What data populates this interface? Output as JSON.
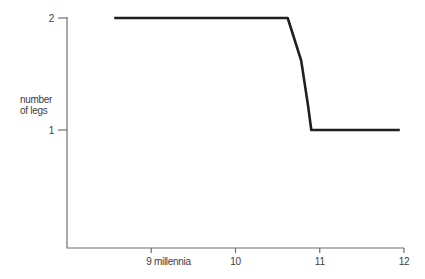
{
  "page": {
    "background": "#ffffff"
  },
  "chart_data": {
    "type": "line",
    "title": "",
    "xlabel": "millennia",
    "ylabel": "number of legs",
    "xlim": [
      8,
      12
    ],
    "ylim": [
      0,
      2.1
    ],
    "grid": false,
    "legend": "none",
    "x_ticks": [
      {
        "value": 9,
        "label": "9 millennia"
      },
      {
        "value": 10,
        "label": "10"
      },
      {
        "value": 11,
        "label": "11"
      },
      {
        "value": 12,
        "label": "12"
      }
    ],
    "y_ticks": [
      {
        "value": 2,
        "label": "2"
      },
      {
        "value": 1,
        "label": "1"
      }
    ],
    "series": [
      {
        "name": "number of legs",
        "color": "#1f1f1f",
        "points": [
          [
            8.56,
            2
          ],
          [
            10.62,
            2
          ],
          [
            10.78,
            1.62
          ],
          [
            10.86,
            1.22
          ],
          [
            10.9,
            1
          ],
          [
            11.95,
            1
          ]
        ]
      }
    ],
    "colors": {
      "axis": "#6f6f6f",
      "text": "#3d3d3d"
    }
  }
}
